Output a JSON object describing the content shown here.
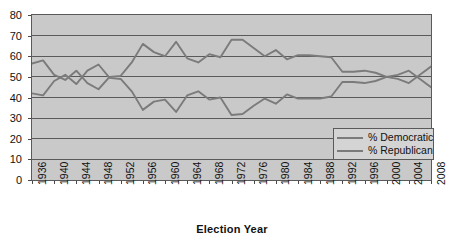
{
  "chart_data": {
    "type": "line",
    "title": "",
    "xlabel": "Election Year",
    "ylabel": "",
    "ylim": [
      0,
      80
    ],
    "ytick_step": 10,
    "yticks": [
      0,
      10,
      20,
      30,
      40,
      50,
      60,
      70,
      80
    ],
    "grid": true,
    "grid_axis": "y",
    "legend_position": "inside-bottom-right",
    "x": [
      1936,
      1938,
      1940,
      1942,
      1944,
      1946,
      1948,
      1950,
      1952,
      1954,
      1956,
      1958,
      1960,
      1962,
      1964,
      1966,
      1968,
      1970,
      1972,
      1974,
      1976,
      1978,
      1980,
      1982,
      1984,
      1986,
      1988,
      1990,
      1992,
      1994,
      1996,
      1998,
      2000,
      2002,
      2004,
      2006,
      2008
    ],
    "xtick_labels": [
      "1936",
      "1940",
      "1944",
      "1948",
      "1952",
      "1956",
      "1960",
      "1964",
      "1968",
      "1972",
      "1976",
      "1980",
      "1984",
      "1988",
      "1992",
      "1996",
      "2000",
      "2004",
      "2008"
    ],
    "xtick_values": [
      1936,
      1940,
      1944,
      1948,
      1952,
      1956,
      1960,
      1964,
      1968,
      1972,
      1976,
      1980,
      1984,
      1988,
      1992,
      1996,
      2000,
      2004,
      2008
    ],
    "xtick_rotation": -90,
    "series": [
      {
        "name": "% Democratic",
        "color": "#7b7b7b",
        "values": [
          56.5,
          58,
          51,
          48.5,
          53,
          47,
          44,
          50,
          50.5,
          57,
          66,
          62,
          60,
          67,
          59,
          57,
          61,
          59.5,
          68,
          68,
          64,
          60,
          63,
          58.5,
          60.5,
          60.5,
          60,
          59.5,
          52.5,
          52.5,
          53,
          52,
          50,
          49,
          47,
          51,
          55
        ]
      },
      {
        "name": "% Republican",
        "color": "#7b7b7b",
        "values": [
          42,
          41,
          48,
          51,
          46.5,
          53,
          56,
          49.5,
          49,
          43,
          34,
          38,
          39,
          33,
          41,
          43,
          39,
          40,
          31.5,
          32,
          36,
          39.5,
          37,
          41.5,
          39.5,
          39.5,
          39.5,
          40.5,
          47.5,
          47.5,
          47,
          48,
          50,
          51,
          53,
          49,
          45
        ]
      }
    ]
  },
  "legend": {
    "entries": [
      {
        "label": "% Democratic"
      },
      {
        "label": "% Republican"
      }
    ]
  },
  "axis": {
    "x_title": "Election Year"
  },
  "style": {
    "plot_background": "#c9c9c9",
    "page_background": "#ffffff",
    "line_color": "#7b7b7b",
    "grid_color": "#5a5a5a",
    "border_color": "#5a5a5a",
    "text_color": "#111111"
  }
}
